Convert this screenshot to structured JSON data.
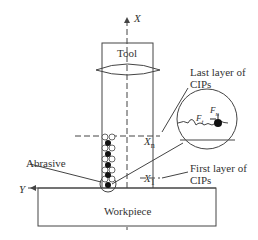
{
  "diagram": {
    "axis_x": "X",
    "axis_y": "Y",
    "tool": "Tool",
    "workpiece": "Workpiece",
    "abrasive": "Abrasive",
    "last_layer": [
      "Last layer of",
      "CIPs"
    ],
    "first_layer": [
      "First layer of",
      "CIPs"
    ],
    "xn": "X",
    "xn_sub": "n",
    "x1": "X",
    "x1_sub": "1",
    "fn": "F",
    "fn_sub": "n",
    "ft": "F",
    "ft_sub": "t"
  }
}
